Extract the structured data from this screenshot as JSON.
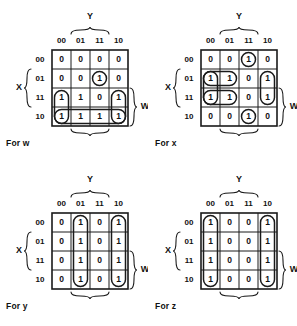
{
  "figure": {
    "type": "karnaugh-map-set",
    "map_count": 4,
    "variables": [
      "W",
      "X",
      "Y",
      "Z"
    ],
    "row_labels": [
      "00",
      "01",
      "11",
      "10"
    ],
    "column_labels": [
      "00",
      "01",
      "11",
      "10"
    ],
    "top_variable_label": "Y",
    "left_variable_label": "X",
    "right_variable_label": "W",
    "bottom_variable_label": "Z"
  },
  "maps": [
    {
      "caption": "For w",
      "output": "w",
      "cells": [
        [
          "0",
          "0",
          "0",
          "0"
        ],
        [
          "0",
          "0",
          "1",
          "0"
        ],
        [
          "1",
          "1",
          "0",
          "1"
        ],
        [
          "1",
          "1",
          "1",
          "1"
        ]
      ],
      "groups": [
        {
          "name": "single-cell-row01-col11",
          "shape": "oval",
          "row": 1,
          "col": 2,
          "rows": 1,
          "cols": 1
        },
        {
          "name": "vertical-pair-col00-rows11-10",
          "shape": "oval",
          "row": 2,
          "col": 0,
          "rows": 2,
          "cols": 1
        },
        {
          "name": "vertical-pair-col10-rows11-10",
          "shape": "oval",
          "row": 2,
          "col": 3,
          "rows": 2,
          "cols": 1
        },
        {
          "name": "horizontal-quad-row10",
          "shape": "oval",
          "row": 3,
          "col": 0,
          "rows": 1,
          "cols": 4
        }
      ]
    },
    {
      "caption": "For x",
      "output": "x",
      "cells": [
        [
          "0",
          "0",
          "1",
          "0"
        ],
        [
          "1",
          "1",
          "0",
          "1"
        ],
        [
          "1",
          "1",
          "0",
          "1"
        ],
        [
          "0",
          "0",
          "1",
          "0"
        ]
      ],
      "groups": [
        {
          "name": "single-cell-row00-col11",
          "shape": "oval",
          "row": 0,
          "col": 2,
          "rows": 1,
          "cols": 1
        },
        {
          "name": "single-cell-row10-col11",
          "shape": "oval",
          "row": 3,
          "col": 2,
          "rows": 1,
          "cols": 1
        },
        {
          "name": "vertical-pair-col00-rows01-11",
          "shape": "oval",
          "row": 1,
          "col": 0,
          "rows": 2,
          "cols": 1
        },
        {
          "name": "vertical-pair-col10-rows01-11",
          "shape": "oval",
          "row": 1,
          "col": 3,
          "rows": 2,
          "cols": 1
        },
        {
          "name": "horizontal-pair-row01-cols00-01",
          "shape": "oval",
          "row": 1,
          "col": 0,
          "rows": 1,
          "cols": 2
        },
        {
          "name": "horizontal-pair-row11-cols00-01",
          "shape": "oval",
          "row": 2,
          "col": 0,
          "rows": 1,
          "cols": 2
        }
      ]
    },
    {
      "caption": "For y",
      "output": "y",
      "cells": [
        [
          "0",
          "1",
          "0",
          "1"
        ],
        [
          "0",
          "1",
          "0",
          "1"
        ],
        [
          "0",
          "1",
          "0",
          "1"
        ],
        [
          "0",
          "1",
          "0",
          "1"
        ]
      ],
      "groups": [
        {
          "name": "vertical-quad-col01",
          "shape": "oval",
          "row": 0,
          "col": 1,
          "rows": 4,
          "cols": 1
        },
        {
          "name": "vertical-quad-col10",
          "shape": "oval",
          "row": 0,
          "col": 3,
          "rows": 4,
          "cols": 1
        }
      ]
    },
    {
      "caption": "For z",
      "output": "z",
      "cells": [
        [
          "1",
          "0",
          "0",
          "1"
        ],
        [
          "1",
          "0",
          "0",
          "1"
        ],
        [
          "1",
          "0",
          "0",
          "1"
        ],
        [
          "1",
          "0",
          "0",
          "1"
        ]
      ],
      "groups": [
        {
          "name": "vertical-quad-col00",
          "shape": "oval",
          "row": 0,
          "col": 0,
          "rows": 4,
          "cols": 1
        },
        {
          "name": "vertical-quad-col10",
          "shape": "oval",
          "row": 0,
          "col": 3,
          "rows": 4,
          "cols": 1
        }
      ]
    }
  ],
  "colors": {
    "ink": "#1a1a1a",
    "background": "#ffffff"
  }
}
